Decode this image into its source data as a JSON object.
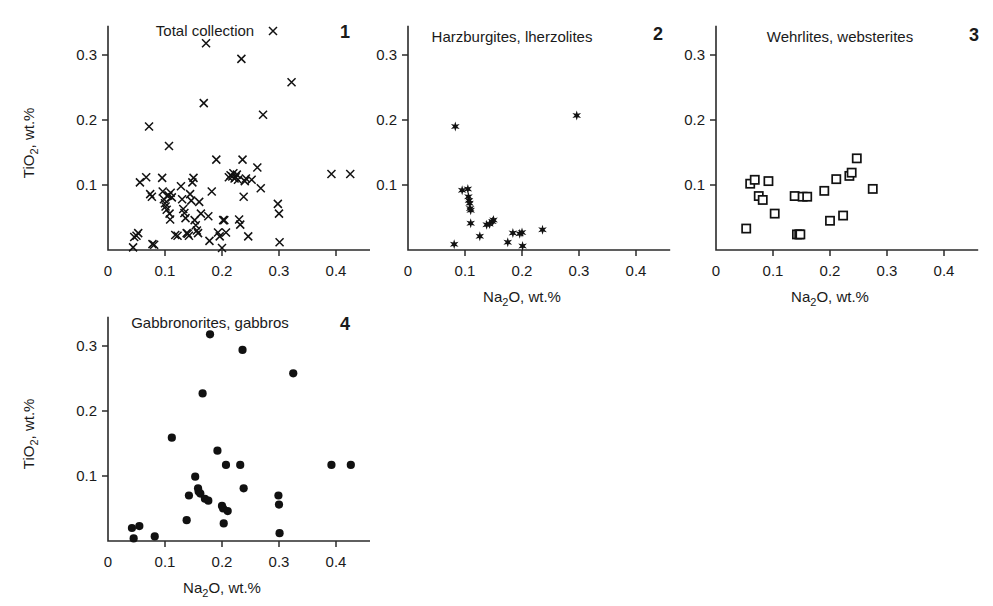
{
  "figure": {
    "axis_label_x": "Na2O, wt.%",
    "axis_label_x_base": "Na",
    "axis_label_x_sub": "2",
    "axis_label_x_rest": "O, wt.%",
    "axis_label_y_base": "TiO",
    "axis_label_y_sub": "2",
    "axis_label_y_rest": ", wt.%",
    "x_ticks": [
      "0",
      "0.1",
      "0.2",
      "0.3",
      "0.4"
    ],
    "y_ticks": [
      "0.1",
      "0.2",
      "0.3"
    ],
    "marker_color": "#111111"
  },
  "chart_data": [
    {
      "type": "scatter",
      "panel": "1",
      "title": "Total collection",
      "marker": "x",
      "xlabel": "",
      "ylabel": "TiO2, wt.%",
      "xlim": [
        0,
        0.46
      ],
      "ylim": [
        0,
        0.345
      ],
      "xticks": [
        0,
        0.1,
        0.2,
        0.3,
        0.4
      ],
      "yticks": [
        0.1,
        0.2,
        0.3
      ],
      "grid": false,
      "legend": "inline-title",
      "points": [
        [
          0.044,
          0.004
        ],
        [
          0.046,
          0.02
        ],
        [
          0.05,
          0.022
        ],
        [
          0.053,
          0.026
        ],
        [
          0.056,
          0.104
        ],
        [
          0.067,
          0.112
        ],
        [
          0.072,
          0.19
        ],
        [
          0.074,
          0.086
        ],
        [
          0.077,
          0.082
        ],
        [
          0.078,
          0.009
        ],
        [
          0.081,
          0.008
        ],
        [
          0.095,
          0.111
        ],
        [
          0.096,
          0.09
        ],
        [
          0.098,
          0.078
        ],
        [
          0.1,
          0.072
        ],
        [
          0.101,
          0.067
        ],
        [
          0.103,
          0.062
        ],
        [
          0.104,
          0.083
        ],
        [
          0.106,
          0.084
        ],
        [
          0.107,
          0.16
        ],
        [
          0.108,
          0.056
        ],
        [
          0.109,
          0.047
        ],
        [
          0.11,
          0.088
        ],
        [
          0.112,
          0.081
        ],
        [
          0.118,
          0.023
        ],
        [
          0.122,
          0.022
        ],
        [
          0.128,
          0.098
        ],
        [
          0.13,
          0.078
        ],
        [
          0.132,
          0.063
        ],
        [
          0.134,
          0.057
        ],
        [
          0.136,
          0.049
        ],
        [
          0.138,
          0.026
        ],
        [
          0.14,
          0.025
        ],
        [
          0.142,
          0.022
        ],
        [
          0.144,
          0.086
        ],
        [
          0.146,
          0.076
        ],
        [
          0.148,
          0.104
        ],
        [
          0.15,
          0.111
        ],
        [
          0.152,
          0.046
        ],
        [
          0.154,
          0.038
        ],
        [
          0.156,
          0.03
        ],
        [
          0.158,
          0.026
        ],
        [
          0.16,
          0.074
        ],
        [
          0.163,
          0.056
        ],
        [
          0.168,
          0.226
        ],
        [
          0.172,
          0.318
        ],
        [
          0.176,
          0.052
        ],
        [
          0.178,
          0.014
        ],
        [
          0.182,
          0.09
        ],
        [
          0.19,
          0.139
        ],
        [
          0.193,
          0.027
        ],
        [
          0.196,
          0.021
        ],
        [
          0.2,
          0.003
        ],
        [
          0.202,
          0.046
        ],
        [
          0.204,
          0.046
        ],
        [
          0.207,
          0.027
        ],
        [
          0.212,
          0.112
        ],
        [
          0.215,
          0.115
        ],
        [
          0.218,
          0.113
        ],
        [
          0.22,
          0.118
        ],
        [
          0.222,
          0.11
        ],
        [
          0.224,
          0.112
        ],
        [
          0.226,
          0.116
        ],
        [
          0.228,
          0.108
        ],
        [
          0.23,
          0.047
        ],
        [
          0.232,
          0.039
        ],
        [
          0.234,
          0.294
        ],
        [
          0.236,
          0.139
        ],
        [
          0.238,
          0.082
        ],
        [
          0.24,
          0.106
        ],
        [
          0.242,
          0.11
        ],
        [
          0.246,
          0.021
        ],
        [
          0.252,
          0.108
        ],
        [
          0.262,
          0.127
        ],
        [
          0.268,
          0.095
        ],
        [
          0.272,
          0.208
        ],
        [
          0.298,
          0.071
        ],
        [
          0.3,
          0.056
        ],
        [
          0.301,
          0.012
        ],
        [
          0.322,
          0.258
        ],
        [
          0.392,
          0.117
        ],
        [
          0.425,
          0.117
        ]
      ]
    },
    {
      "type": "scatter",
      "panel": "2",
      "title": "Harzburgites, lherzolites",
      "marker": "star",
      "xlabel": "Na2O, wt.%",
      "ylabel": "",
      "xlim": [
        0,
        0.46
      ],
      "ylim": [
        0,
        0.345
      ],
      "xticks": [
        0,
        0.1,
        0.2,
        0.3,
        0.4
      ],
      "yticks": [
        0.1,
        0.2,
        0.3
      ],
      "grid": false,
      "points": [
        [
          0.081,
          0.009
        ],
        [
          0.083,
          0.19
        ],
        [
          0.095,
          0.092
        ],
        [
          0.105,
          0.094
        ],
        [
          0.106,
          0.082
        ],
        [
          0.107,
          0.076
        ],
        [
          0.108,
          0.072
        ],
        [
          0.109,
          0.064
        ],
        [
          0.11,
          0.061
        ],
        [
          0.11,
          0.041
        ],
        [
          0.126,
          0.021
        ],
        [
          0.138,
          0.039
        ],
        [
          0.143,
          0.04
        ],
        [
          0.148,
          0.044
        ],
        [
          0.15,
          0.046
        ],
        [
          0.175,
          0.012
        ],
        [
          0.184,
          0.026
        ],
        [
          0.196,
          0.025
        ],
        [
          0.2,
          0.027
        ],
        [
          0.201,
          0.006
        ],
        [
          0.236,
          0.031
        ],
        [
          0.296,
          0.207
        ]
      ]
    },
    {
      "type": "scatter",
      "panel": "3",
      "title": "Wehrlites, websterites",
      "marker": "square",
      "xlabel": "Na2O, wt.%",
      "ylabel": "",
      "xlim": [
        0,
        0.46
      ],
      "ylim": [
        0,
        0.345
      ],
      "xticks": [
        0,
        0.1,
        0.2,
        0.3,
        0.4
      ],
      "yticks": [
        0.1,
        0.2,
        0.3
      ],
      "grid": false,
      "points": [
        [
          0.053,
          0.033
        ],
        [
          0.06,
          0.102
        ],
        [
          0.068,
          0.108
        ],
        [
          0.075,
          0.083
        ],
        [
          0.082,
          0.077
        ],
        [
          0.092,
          0.106
        ],
        [
          0.103,
          0.056
        ],
        [
          0.138,
          0.083
        ],
        [
          0.142,
          0.024
        ],
        [
          0.146,
          0.024
        ],
        [
          0.148,
          0.024
        ],
        [
          0.152,
          0.082
        ],
        [
          0.16,
          0.082
        ],
        [
          0.19,
          0.091
        ],
        [
          0.2,
          0.045
        ],
        [
          0.211,
          0.109
        ],
        [
          0.223,
          0.053
        ],
        [
          0.234,
          0.114
        ],
        [
          0.238,
          0.119
        ],
        [
          0.247,
          0.141
        ],
        [
          0.275,
          0.094
        ]
      ]
    },
    {
      "type": "scatter",
      "panel": "4",
      "title": "Gabbronorites, gabbros",
      "marker": "dot",
      "xlabel": "Na2O, wt.%",
      "ylabel": "TiO2, wt.%",
      "xlim": [
        0,
        0.46
      ],
      "ylim": [
        0,
        0.345
      ],
      "xticks": [
        0,
        0.1,
        0.2,
        0.3,
        0.4
      ],
      "yticks": [
        0.1,
        0.2,
        0.3
      ],
      "grid": false,
      "points": [
        [
          0.042,
          0.02
        ],
        [
          0.045,
          0.004
        ],
        [
          0.055,
          0.023
        ],
        [
          0.082,
          0.007
        ],
        [
          0.112,
          0.159
        ],
        [
          0.138,
          0.032
        ],
        [
          0.142,
          0.07
        ],
        [
          0.153,
          0.099
        ],
        [
          0.158,
          0.081
        ],
        [
          0.159,
          0.076
        ],
        [
          0.162,
          0.073
        ],
        [
          0.166,
          0.227
        ],
        [
          0.17,
          0.065
        ],
        [
          0.176,
          0.062
        ],
        [
          0.179,
          0.318
        ],
        [
          0.192,
          0.139
        ],
        [
          0.2,
          0.054
        ],
        [
          0.202,
          0.05
        ],
        [
          0.203,
          0.027
        ],
        [
          0.207,
          0.117
        ],
        [
          0.21,
          0.046
        ],
        [
          0.232,
          0.117
        ],
        [
          0.236,
          0.294
        ],
        [
          0.238,
          0.081
        ],
        [
          0.299,
          0.07
        ],
        [
          0.3,
          0.056
        ],
        [
          0.301,
          0.012
        ],
        [
          0.325,
          0.258
        ],
        [
          0.392,
          0.117
        ],
        [
          0.426,
          0.117
        ]
      ]
    }
  ]
}
